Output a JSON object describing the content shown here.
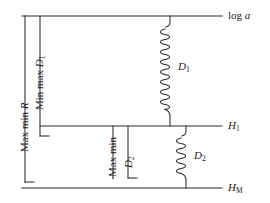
{
  "figure": {
    "type": "technical-line-diagram",
    "background_color": "#ffffff",
    "line_color": "#2a2a2a",
    "baselines": [
      {
        "id": "log-a",
        "label_plain": "log a",
        "label_main": "log ",
        "label_italic": "a",
        "label_sub": ""
      },
      {
        "id": "h1",
        "label_plain": "H1",
        "label_main": "H",
        "label_italic": "H",
        "label_sub": "1"
      },
      {
        "id": "hm",
        "label_plain": "HM",
        "label_main": "H",
        "label_italic": "H",
        "label_sub": "M"
      }
    ],
    "brackets": [
      {
        "id": "max-min-r",
        "text_main": "Max min ",
        "text_italic": "R",
        "text_sub": ""
      },
      {
        "id": "min-max-d1",
        "text_main": "Min max ",
        "text_italic": "D",
        "text_sub": "1"
      },
      {
        "id": "max-min",
        "text_main": "Max min",
        "text_italic": "",
        "text_sub": ""
      },
      {
        "id": "d2-bracket",
        "text_main": "",
        "text_italic": "D",
        "text_sub": "2"
      }
    ],
    "springs": [
      {
        "id": "spring-d1",
        "label_italic": "D",
        "label_sub": "1",
        "coils": 17
      },
      {
        "id": "spring-d2",
        "label_italic": "D",
        "label_sub": "2",
        "coils": 11
      }
    ]
  }
}
